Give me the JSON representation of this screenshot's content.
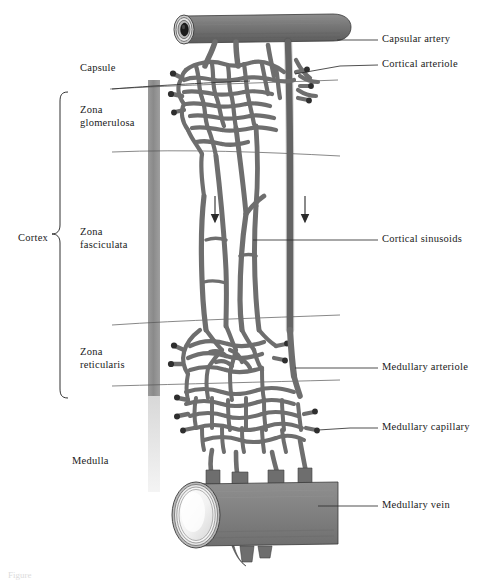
{
  "figure": {
    "type": "anatomical-diagram",
    "background_color": "#ffffff",
    "vessel_color": "#6e6e6e",
    "vessel_outline_color": "#2a2a2a",
    "capsule_band_color": "#8c8c8c",
    "label_color": "#1a1a1a",
    "leader_line_color": "#303030"
  },
  "left_labels": {
    "capsule": "Capsule",
    "zona_glomerulosa_line1": "Zona",
    "zona_glomerulosa_line2": "glomerulosa",
    "zona_fasciculata_line1": "Zona",
    "zona_fasciculata_line2": "fasciculata",
    "zona_reticularis_line1": "Zona",
    "zona_reticularis_line2": "reticularis",
    "medulla": "Medulla",
    "cortex": "Cortex"
  },
  "right_labels": {
    "capsular_artery": "Capsular artery",
    "cortical_arteriole": "Cortical arteriole",
    "cortical_sinusoids": "Cortical sinusoids",
    "medullary_arteriole": "Medullary arteriole",
    "medullary_capillary": "Medullary capillary",
    "medullary_vein": "Medullary vein"
  },
  "annotations": {
    "flow_arrow_left": "downward-flow-arrow",
    "flow_arrow_right": "downward-flow-arrow",
    "caption_partial": "Figure"
  }
}
